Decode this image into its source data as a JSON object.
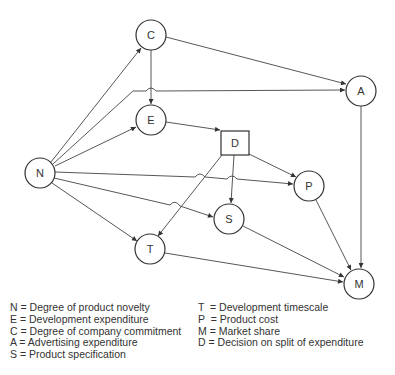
{
  "nodes": {
    "C": {
      "label": "C"
    },
    "A": {
      "label": "A"
    },
    "E": {
      "label": "E"
    },
    "D": {
      "label": "D"
    },
    "N": {
      "label": "N"
    },
    "P": {
      "label": "P"
    },
    "S": {
      "label": "S"
    },
    "T": {
      "label": "T"
    },
    "M": {
      "label": "M"
    }
  },
  "edges": [
    {
      "from": "N",
      "to": "C"
    },
    {
      "from": "N",
      "to": "A"
    },
    {
      "from": "N",
      "to": "E"
    },
    {
      "from": "N",
      "to": "P"
    },
    {
      "from": "N",
      "to": "S"
    },
    {
      "from": "N",
      "to": "T"
    },
    {
      "from": "C",
      "to": "E"
    },
    {
      "from": "C",
      "to": "A"
    },
    {
      "from": "E",
      "to": "D"
    },
    {
      "from": "D",
      "to": "P"
    },
    {
      "from": "D",
      "to": "S"
    },
    {
      "from": "D",
      "to": "T"
    },
    {
      "from": "A",
      "to": "M"
    },
    {
      "from": "P",
      "to": "M"
    },
    {
      "from": "S",
      "to": "M"
    },
    {
      "from": "T",
      "to": "M"
    }
  ],
  "legend": {
    "left": [
      "N = Degree of product novelty",
      "E = Development expenditure",
      "C = Degree of company commitment",
      "A = Advertising expenditure",
      "S = Product specification"
    ],
    "right": [
      "T  = Development timescale",
      "P  = Product cost",
      "M = Market share",
      "D = Decision on split of expenditure"
    ]
  }
}
